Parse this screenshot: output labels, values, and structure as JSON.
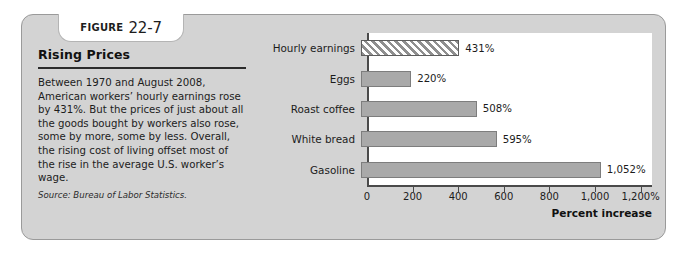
{
  "figure": {
    "label_word": "FIGURE",
    "number": "22-7",
    "title": "Rising Prices",
    "body": "Between 1970 and August 2008, American workers’ hourly earnings rose by 431%. But the prices of just about all the goods bought by workers also rose, some by more, some by less. Overall, the rising cost of living offset most of the rise in the average U.S. worker’s wage.",
    "source": "Source: Bureau of Labor Statistics."
  },
  "chart_data": {
    "type": "bar",
    "orientation": "horizontal",
    "title": "",
    "xlabel": "Percent increase",
    "ylabel": "",
    "xlim": [
      0,
      1250
    ],
    "grid": false,
    "legend": "none",
    "categories": [
      "Hourly earnings",
      "Eggs",
      "Roast coffee",
      "White bread",
      "Gasoline"
    ],
    "values": [
      431,
      220,
      508,
      595,
      1052
    ],
    "value_labels": [
      "431%",
      "220%",
      "508%",
      "595%",
      "1,052%"
    ],
    "styles": [
      "hatched",
      "solid",
      "solid",
      "solid",
      "solid"
    ],
    "tick_values": [
      0,
      200,
      400,
      600,
      800,
      1000,
      1200
    ],
    "tick_labels": [
      "0",
      "200",
      "400",
      "600",
      "800",
      "1,000",
      "1,200%"
    ]
  },
  "colors": {
    "card_background": "#d3d3d3",
    "plot_background": "#ffffff",
    "bar_fill": "#a9a9a9",
    "bar_outline": "#7d7d7d",
    "axis": "#4a4a4a",
    "text": "#1c1c1c"
  }
}
